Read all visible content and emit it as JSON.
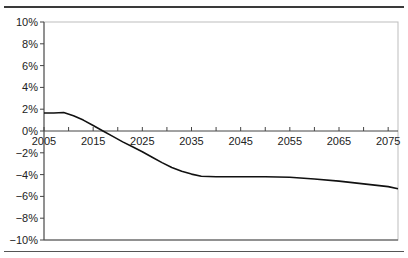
{
  "chart_data": {
    "type": "line",
    "title": "",
    "xlabel": "",
    "ylabel": "",
    "xlim": [
      2005,
      2077
    ],
    "ylim": [
      -10,
      10
    ],
    "grid": false,
    "legend": null,
    "x_ticks": [
      "2005",
      "2015",
      "2025",
      "2035",
      "2045",
      "2055",
      "2065",
      "2075"
    ],
    "y_ticks": [
      "10%",
      "8%",
      "6%",
      "4%",
      "2%",
      "0%",
      "−2%",
      "−4%",
      "−6%",
      "−8%",
      "−10%"
    ],
    "series": [
      {
        "name": "series-1",
        "color": "#111111",
        "x": [
          2005,
          2007,
          2009,
          2011,
          2013,
          2015,
          2017,
          2019,
          2021,
          2023,
          2025,
          2027,
          2029,
          2031,
          2033,
          2035,
          2037,
          2040,
          2045,
          2050,
          2055,
          2060,
          2065,
          2070,
          2075,
          2077
        ],
        "values": [
          1.65,
          1.65,
          1.7,
          1.4,
          1.0,
          0.5,
          0.0,
          -0.5,
          -1.0,
          -1.45,
          -1.9,
          -2.4,
          -2.9,
          -3.35,
          -3.7,
          -3.95,
          -4.15,
          -4.2,
          -4.2,
          -4.2,
          -4.25,
          -4.4,
          -4.6,
          -4.85,
          -5.1,
          -5.3
        ]
      }
    ]
  }
}
